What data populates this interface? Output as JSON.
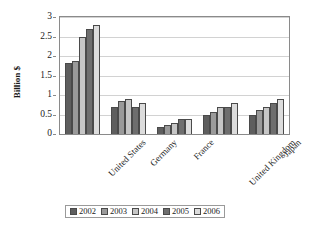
{
  "chart_data": {
    "type": "bar",
    "title": "",
    "xlabel": "",
    "ylabel": "Billion $",
    "ylim": [
      0,
      3
    ],
    "yticks": [
      0,
      0.5,
      1,
      1.5,
      2,
      2.5,
      3
    ],
    "ytick_labels": [
      "0",
      "0.5",
      "1",
      "1.5",
      "2",
      "2.5",
      "3"
    ],
    "grid": true,
    "legend_position": "bottom",
    "categories": [
      "United States",
      "Germany",
      "France",
      "United Kingdom",
      "Japan"
    ],
    "series": [
      {
        "name": "2002",
        "color": "#5e5e5e",
        "values": [
          1.83,
          0.7,
          0.19,
          0.5,
          0.48
        ]
      },
      {
        "name": "2003",
        "color": "#9a9a9a",
        "values": [
          1.88,
          0.85,
          0.24,
          0.57,
          0.62
        ]
      },
      {
        "name": "2004",
        "color": "#c6c6c6",
        "values": [
          2.49,
          0.9,
          0.29,
          0.68,
          0.68
        ]
      },
      {
        "name": "2005",
        "color": "#6e6e6e",
        "values": [
          2.68,
          0.7,
          0.39,
          0.68,
          0.79
        ]
      },
      {
        "name": "2006",
        "color": "#dcdcdc",
        "values": [
          2.8,
          0.8,
          0.38,
          0.79,
          0.89
        ]
      }
    ]
  }
}
